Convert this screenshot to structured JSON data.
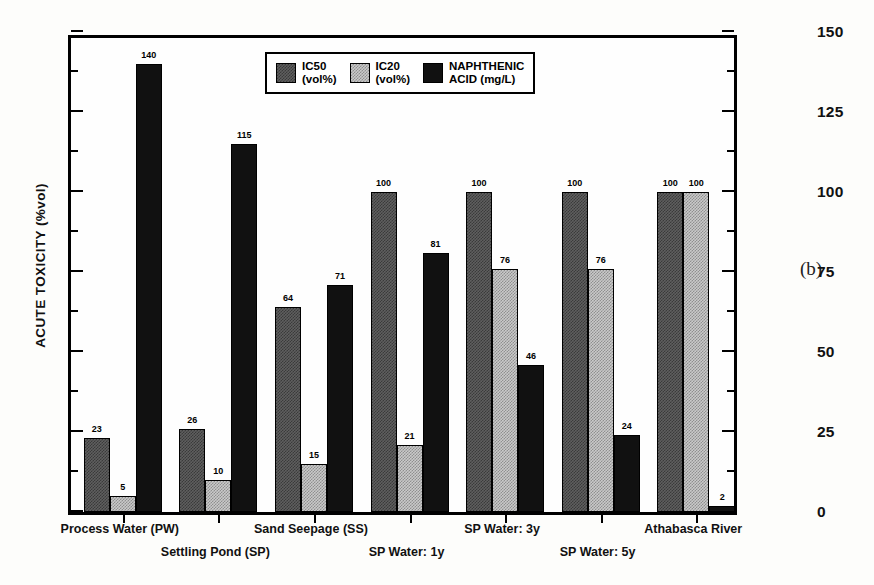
{
  "panel_tag": "(b)",
  "legend": {
    "position": "top-center-inside",
    "items": [
      {
        "key": "ic50",
        "label": "IC50\n(vol%)",
        "swatch": "dark-checker-swatch"
      },
      {
        "key": "ic20",
        "label": "IC20\n(vol%)",
        "swatch": "light-checker-swatch"
      },
      {
        "key": "na",
        "label": "NAPHTHENIC\nACID (mg/L)",
        "swatch": "solid-black-swatch"
      }
    ]
  },
  "axes": {
    "left": {
      "title": "ACUTE TOXICITY (%vol)",
      "ticks": [
        0,
        25,
        50,
        75,
        100,
        125,
        150
      ],
      "min": 0,
      "max": 150,
      "minor_interval": 12.5
    },
    "right": {
      "title": "CONCENTRATION (mg/L)",
      "ticks": [
        0,
        25,
        50,
        75,
        100,
        125,
        150
      ],
      "min": 0,
      "max": 150,
      "minor_interval": 12.5
    }
  },
  "chart_data": {
    "type": "bar",
    "title": "",
    "xlabel": "",
    "ylabel": "ACUTE TOXICITY (%vol)",
    "y2label": "CONCENTRATION (mg/L)",
    "ylim": [
      0,
      150
    ],
    "y2lim": [
      0,
      150
    ],
    "grid": false,
    "legend_position": "upper center",
    "categories": [
      "Process Water (PW)",
      "Settling Pond (SP)",
      "Sand Seepage (SS)",
      "SP Water: 1y",
      "SP Water: 3y",
      "SP Water: 5y",
      "Athabasca River"
    ],
    "series": [
      {
        "name": "IC50 (vol%)",
        "axis": "left",
        "values": [
          23,
          26,
          64,
          100,
          100,
          100,
          100
        ]
      },
      {
        "name": "IC20 (vol%)",
        "axis": "left",
        "values": [
          5,
          10,
          15,
          21,
          76,
          76,
          100
        ]
      },
      {
        "name": "NAPHTHENIC ACID (mg/L)",
        "axis": "right",
        "values": [
          140,
          115,
          71,
          81,
          46,
          24,
          2
        ]
      }
    ]
  },
  "category_label_rows": [
    0,
    1,
    0,
    1,
    0,
    1,
    0
  ]
}
